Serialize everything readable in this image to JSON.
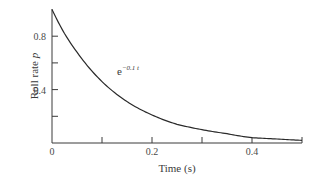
{
  "chart_data": {
    "type": "line",
    "title": "",
    "xlabel": "Time (s)",
    "ylabel": "Roll rate p",
    "ylabel_main": "Roll rate ",
    "ylabel_symbol": "p",
    "xlim": [
      0,
      0.5
    ],
    "ylim": [
      0,
      1.0
    ],
    "grid": false,
    "legend": "none",
    "x_ticks": [
      0,
      0.1,
      0.2,
      0.3,
      0.4,
      0.5
    ],
    "x_tick_labels": [
      {
        "value": 0,
        "label": "0"
      },
      {
        "value": 0.2,
        "label": "0.2"
      },
      {
        "value": 0.4,
        "label": "0.4"
      }
    ],
    "y_ticks": [
      0.2,
      0.4,
      0.6,
      0.8
    ],
    "y_tick_labels": [
      {
        "value": 0.4,
        "label": "0.4"
      },
      {
        "value": 0.8,
        "label": "0.8"
      }
    ],
    "annotation": {
      "base": "e",
      "exponent": "−0.1 t",
      "x": 0.13,
      "y": 0.55
    },
    "series": [
      {
        "name": "e^(−0.1t)",
        "x": [
          0,
          0.025,
          0.05,
          0.075,
          0.1,
          0.15,
          0.2,
          0.25,
          0.3,
          0.35,
          0.4,
          0.45,
          0.5
        ],
        "values": [
          1.0,
          0.82,
          0.68,
          0.56,
          0.46,
          0.31,
          0.21,
          0.14,
          0.1,
          0.07,
          0.04,
          0.03,
          0.02
        ]
      }
    ]
  },
  "colors": {
    "line": "#2a2a2a",
    "axis": "#3a3a3a",
    "background": "#ffffff"
  }
}
